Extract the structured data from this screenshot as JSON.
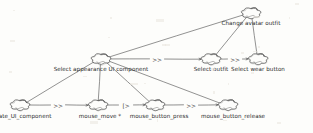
{
  "diagram": {
    "style": "hand-drawn cloud nodes with directed edges",
    "background_color": "#fdfdfb",
    "stroke_color": "#4a4a4a",
    "text_color": "#2b2b2b"
  },
  "nodes": [
    {
      "id": "change_avatar_outfit",
      "label": "Change avatar outfit",
      "level": 0,
      "x": 251,
      "y": 13,
      "label_x": 251,
      "label_y": 20
    },
    {
      "id": "select_appearance_ui_component",
      "label": "Select appearance UI component",
      "level": 1,
      "x": 101,
      "y": 59,
      "label_x": 101,
      "label_y": 66
    },
    {
      "id": "select_outfit",
      "label": "Select outfit",
      "level": 1,
      "x": 211,
      "y": 59,
      "label_x": 211,
      "label_y": 66
    },
    {
      "id": "select_wear_button",
      "label": "Select wear button",
      "level": 1,
      "x": 258,
      "y": 59,
      "label_x": 258,
      "label_y": 66
    },
    {
      "id": "locate_ui_component",
      "label": "locate_UI_component",
      "level": 2,
      "x": 20,
      "y": 105,
      "label_x": 21,
      "label_y": 113
    },
    {
      "id": "mouse_move",
      "label": "mouse_move *",
      "level": 2,
      "x": 98,
      "y": 105,
      "label_x": 100,
      "label_y": 113
    },
    {
      "id": "mouse_button_press",
      "label": "mouse_button_press",
      "level": 2,
      "x": 155,
      "y": 105,
      "label_x": 159,
      "label_y": 113
    },
    {
      "id": "mouse_button_release",
      "label": "mouse_button_release",
      "level": 2,
      "x": 228,
      "y": 105,
      "label_x": 233,
      "label_y": 113
    }
  ],
  "operators": [
    {
      "id": "op-appearance-to-outfit",
      "symbol": ">>",
      "name": "enabling",
      "from": "select_appearance_ui_component",
      "to": "select_outfit",
      "x": 157,
      "y": 59
    },
    {
      "id": "op-outfit-to-wear",
      "symbol": ">>",
      "name": "enabling",
      "from": "select_outfit",
      "to": "select_wear_button",
      "x": 235,
      "y": 59
    },
    {
      "id": "op-locate-to-move",
      "symbol": ">>",
      "name": "enabling",
      "from": "locate_ui_component",
      "to": "mouse_move",
      "x": 58,
      "y": 105
    },
    {
      "id": "op-move-to-press",
      "symbol": "[>",
      "name": "disabling",
      "from": "mouse_move",
      "to": "mouse_button_press",
      "x": 126,
      "y": 105
    },
    {
      "id": "op-press-to-release",
      "symbol": ">>",
      "name": "enabling",
      "from": "mouse_button_press",
      "to": "mouse_button_release",
      "x": 191,
      "y": 105
    }
  ],
  "decomposition_edges": [
    {
      "id": "edge-root-appearance",
      "parent": "change_avatar_outfit",
      "child": "select_appearance_ui_component"
    },
    {
      "id": "edge-root-outfit",
      "parent": "change_avatar_outfit",
      "child": "select_outfit"
    },
    {
      "id": "edge-root-wear",
      "parent": "change_avatar_outfit",
      "child": "select_wear_button"
    },
    {
      "id": "edge-appearance-locate",
      "parent": "select_appearance_ui_component",
      "child": "locate_ui_component"
    },
    {
      "id": "edge-appearance-move",
      "parent": "select_appearance_ui_component",
      "child": "mouse_move"
    },
    {
      "id": "edge-appearance-press",
      "parent": "select_appearance_ui_component",
      "child": "mouse_button_press"
    },
    {
      "id": "edge-appearance-release",
      "parent": "select_appearance_ui_component",
      "child": "mouse_button_release"
    }
  ]
}
